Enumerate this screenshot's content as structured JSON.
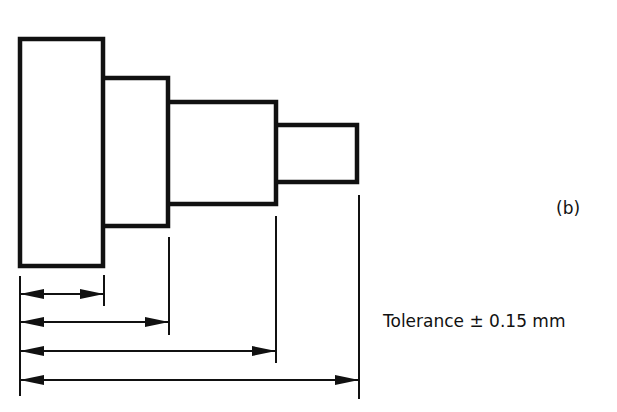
{
  "figure": {
    "label": "(b)",
    "tolerance_text": "Tolerance ± 0.15 mm",
    "tolerance_value": 0.15,
    "tolerance_unit": "mm"
  },
  "colors": {
    "stroke": "#111111",
    "background": "#ffffff"
  },
  "shaft_steps": [
    {
      "name": "step-1",
      "x": 20,
      "y": 39,
      "w": 83,
      "h": 227
    },
    {
      "name": "step-2",
      "x": 103,
      "y": 78,
      "w": 65,
      "h": 148
    },
    {
      "name": "step-3",
      "x": 168,
      "y": 102,
      "w": 108,
      "h": 102
    },
    {
      "name": "step-4",
      "x": 276,
      "y": 125,
      "w": 81,
      "h": 57
    }
  ],
  "dimensions": [
    {
      "name": "dimension-step-1",
      "from_x": 20,
      "to_x": 103,
      "y": 294
    },
    {
      "name": "dimension-step-2",
      "from_x": 20,
      "to_x": 169,
      "y": 322
    },
    {
      "name": "dimension-step-3",
      "from_x": 20,
      "to_x": 276,
      "y": 351
    },
    {
      "name": "dimension-overall",
      "from_x": 20,
      "to_x": 359,
      "y": 380
    }
  ]
}
